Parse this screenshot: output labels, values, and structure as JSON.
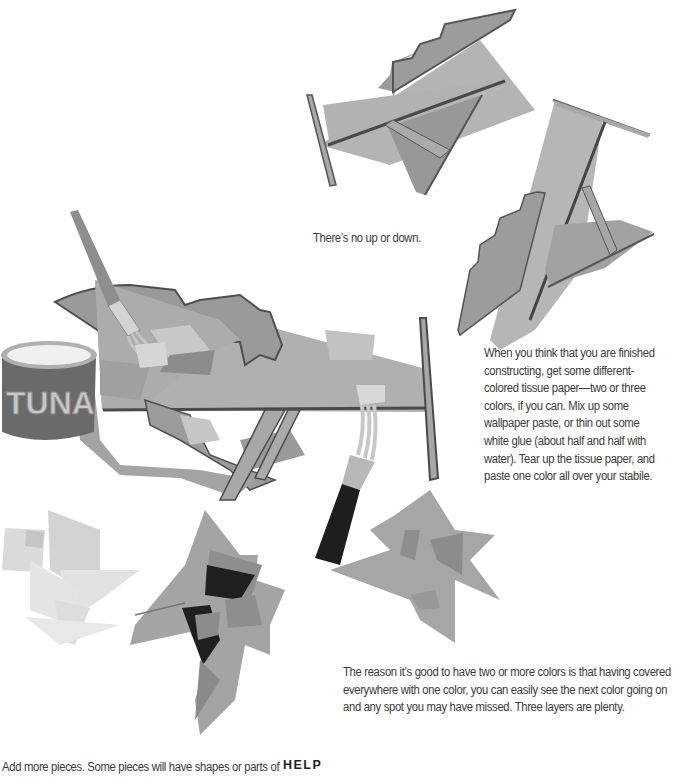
{
  "page": {
    "caption": "There’s no up or down.",
    "paragraph_1": "When you think that you are finished constructing, get some different-colored tissue paper—two or three colors, if you can. Mix up some wallpaper paste, or thin out some white glue (about half and half with water). Tear up the tissue paper, and paste one color all over your stabile.",
    "paragraph_2": "The reason it’s good to have two or more colors is that having covered everywhere with one color, you can easily see the next color going on and any spot you may have missed. Three layers are plenty.",
    "paragraph_3": "Add more pieces. Some pieces will have shapes or parts of",
    "section_heading": "HELP"
  },
  "illustrations": {
    "can_label": "TUNA",
    "colors": {
      "light_gray": "#b8b8b8",
      "mid_gray": "#a0a0a0",
      "dark_gray": "#8a8a8a",
      "edge": "#555555",
      "black": "#1e1e1e",
      "pale": "#dcdcdc"
    }
  }
}
